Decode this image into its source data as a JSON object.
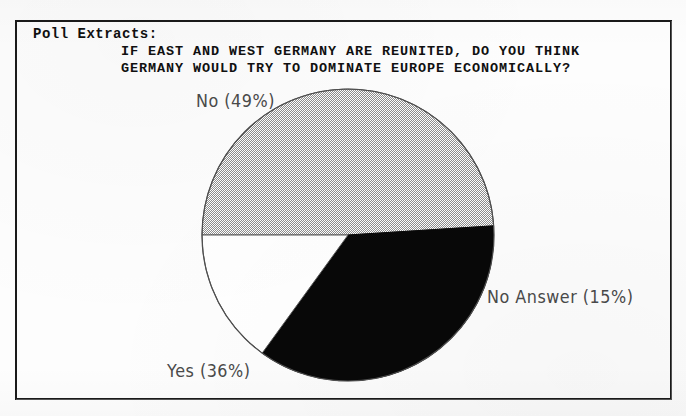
{
  "document": {
    "section_label": "Poll Extracts:",
    "question_line_1": "IF EAST AND WEST GERMANY ARE REUNITED, DO YOU THINK",
    "question_line_2": "GERMANY WOULD TRY TO DOMINATE EUROPE ECONOMICALLY?"
  },
  "labels": {
    "no": "No  (49%)",
    "no_answer": "No Answer  (15%)",
    "yes": "Yes  (36%)"
  },
  "colors": {
    "ink": "#101010",
    "frame": "#1a1a1a",
    "slice_no_gray": "#b9b9b9",
    "slice_yes_black": "#080808",
    "slice_no_answer_white": "#ffffff",
    "label_text": "#4a4a4a",
    "paper": "#fdfdfd"
  },
  "chart_data": {
    "type": "pie",
    "title": "IF EAST AND WEST GERMANY ARE REUNITED, DO YOU THINK GERMANY WOULD TRY TO DOMINATE EUROPE ECONOMICALLY?",
    "subtitle": "Poll Extracts:",
    "categories": [
      "No",
      "Yes",
      "No Answer"
    ],
    "values": [
      49,
      36,
      15
    ],
    "unit": "percent",
    "total": 100,
    "start_angle_deg": 180,
    "direction": "clockwise",
    "legend": "none",
    "labels_position": "outside",
    "slices": [
      {
        "name": "No",
        "value": 49,
        "display": "No  (49%)",
        "fill": "gray-dither",
        "start_deg": 180,
        "sweep_deg": 176.4
      },
      {
        "name": "No Answer",
        "value": 15,
        "display": "No Answer  (15%)",
        "fill": "white",
        "start_deg": 356.4,
        "sweep_deg": 54.0
      },
      {
        "name": "Yes",
        "value": 36,
        "display": "Yes  (36%)",
        "fill": "black",
        "start_deg": 50.4,
        "sweep_deg": 129.6
      }
    ]
  }
}
